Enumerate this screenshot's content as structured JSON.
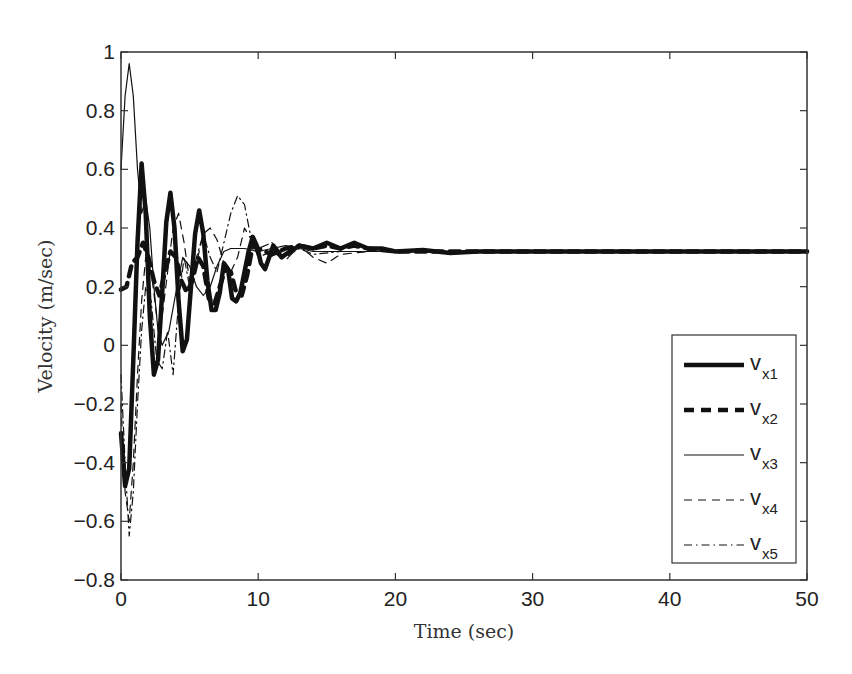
{
  "chart_data": {
    "type": "line",
    "title": "",
    "xlabel": "Time (sec)",
    "ylabel": "Velocity (m/sec)",
    "xlim": [
      0,
      50
    ],
    "ylim": [
      -0.8,
      1
    ],
    "xticks": [
      0,
      10,
      20,
      30,
      40,
      50
    ],
    "yticks": [
      -0.8,
      -0.6,
      -0.4,
      -0.2,
      0,
      0.2,
      0.4,
      0.6,
      0.8,
      1
    ],
    "grid": false,
    "legend_position": "lower right",
    "steady_state_value": 0.32,
    "series": [
      {
        "name": "v_x1",
        "label_main": "v",
        "label_sub": "x1",
        "style": "solid-thick",
        "x": [
          0,
          0.3,
          0.6,
          0.9,
          1.2,
          1.5,
          1.8,
          2.1,
          2.4,
          2.7,
          3.0,
          3.3,
          3.6,
          3.9,
          4.2,
          4.5,
          4.8,
          5.1,
          5.4,
          5.7,
          6.0,
          6.3,
          6.6,
          6.9,
          7.2,
          7.5,
          7.8,
          8.1,
          8.4,
          8.7,
          9.0,
          9.3,
          9.6,
          9.9,
          10.2,
          10.5,
          10.8,
          11.1,
          11.4,
          11.7,
          12,
          13,
          14,
          15,
          16,
          17,
          18,
          19,
          20,
          22,
          24,
          26,
          28,
          30,
          35,
          40,
          45,
          50
        ],
        "y": [
          -0.3,
          -0.48,
          -0.42,
          -0.05,
          0.35,
          0.62,
          0.45,
          0.1,
          -0.1,
          -0.05,
          0.18,
          0.42,
          0.52,
          0.4,
          0.15,
          -0.02,
          0.02,
          0.2,
          0.38,
          0.46,
          0.38,
          0.22,
          0.12,
          0.12,
          0.18,
          0.28,
          0.26,
          0.16,
          0.15,
          0.18,
          0.25,
          0.32,
          0.37,
          0.34,
          0.28,
          0.26,
          0.3,
          0.34,
          0.32,
          0.3,
          0.31,
          0.34,
          0.33,
          0.35,
          0.33,
          0.35,
          0.33,
          0.33,
          0.32,
          0.325,
          0.315,
          0.32,
          0.32,
          0.32,
          0.32,
          0.32,
          0.32,
          0.32
        ]
      },
      {
        "name": "v_x2",
        "label_main": "v",
        "label_sub": "x2",
        "style": "dashed-thick",
        "x": [
          0,
          0.4,
          0.8,
          1.2,
          1.6,
          2.0,
          2.4,
          2.8,
          3.2,
          3.6,
          4.0,
          4.4,
          4.8,
          5.2,
          5.6,
          6.0,
          6.4,
          6.8,
          7.2,
          7.6,
          8.0,
          8.4,
          8.8,
          9.2,
          9.6,
          10,
          11,
          12,
          13,
          14,
          15,
          16,
          17,
          18,
          20,
          25,
          30,
          40,
          50
        ],
        "y": [
          0.19,
          0.2,
          0.28,
          0.3,
          0.35,
          0.3,
          0.22,
          0.17,
          0.25,
          0.32,
          0.3,
          0.22,
          0.18,
          0.22,
          0.3,
          0.27,
          0.16,
          0.14,
          0.2,
          0.26,
          0.25,
          0.18,
          0.17,
          0.24,
          0.34,
          0.33,
          0.31,
          0.33,
          0.34,
          0.33,
          0.34,
          0.33,
          0.34,
          0.33,
          0.32,
          0.32,
          0.32,
          0.32,
          0.32
        ]
      },
      {
        "name": "v_x3",
        "label_main": "v",
        "label_sub": "x3",
        "style": "solid-thin",
        "x": [
          0,
          0.3,
          0.6,
          0.9,
          1.2,
          1.5,
          1.8,
          2.1,
          2.4,
          2.7,
          3.0,
          3.5,
          4.0,
          4.5,
          5.0,
          5.5,
          6.0,
          6.5,
          7.0,
          7.5,
          8.0,
          9.0,
          10,
          11,
          12,
          13,
          14,
          16,
          18,
          20,
          30,
          40,
          50
        ],
        "y": [
          0.6,
          0.85,
          0.96,
          0.85,
          0.6,
          0.45,
          0.5,
          0.4,
          0.2,
          0.05,
          0.0,
          0.05,
          0.18,
          0.3,
          0.27,
          0.2,
          0.17,
          0.2,
          0.27,
          0.32,
          0.33,
          0.33,
          0.32,
          0.33,
          0.34,
          0.33,
          0.32,
          0.32,
          0.32,
          0.32,
          0.32,
          0.32,
          0.32
        ]
      },
      {
        "name": "v_x4",
        "label_main": "v",
        "label_sub": "x4",
        "style": "dashed-thin",
        "x": [
          0,
          0.3,
          0.6,
          0.9,
          1.2,
          1.5,
          1.8,
          2.2,
          2.6,
          3.0,
          3.4,
          3.8,
          4.2,
          4.6,
          5.0,
          5.5,
          6.0,
          6.5,
          7.0,
          7.5,
          8.0,
          8.5,
          9.0,
          9.5,
          10,
          11,
          12,
          13,
          14,
          15,
          16,
          18,
          20,
          30,
          40,
          50
        ],
        "y": [
          -0.2,
          -0.5,
          -0.6,
          -0.4,
          -0.1,
          0.15,
          0.3,
          0.25,
          0.1,
          0.1,
          0.25,
          0.4,
          0.45,
          0.35,
          0.22,
          0.28,
          0.38,
          0.4,
          0.36,
          0.28,
          0.25,
          0.3,
          0.4,
          0.36,
          0.3,
          0.32,
          0.29,
          0.34,
          0.3,
          0.28,
          0.31,
          0.32,
          0.32,
          0.32,
          0.32,
          0.32
        ]
      },
      {
        "name": "v_x5",
        "label_main": "v",
        "label_sub": "x5",
        "style": "dashdot-thin",
        "x": [
          0,
          0.3,
          0.6,
          0.9,
          1.2,
          1.5,
          1.8,
          2.2,
          2.6,
          3.0,
          3.4,
          3.8,
          4.2,
          4.6,
          5.0,
          5.5,
          6.0,
          6.5,
          7.0,
          7.5,
          8.0,
          8.5,
          9.0,
          9.5,
          10,
          11,
          12,
          13,
          14,
          16,
          18,
          20,
          30,
          40,
          50
        ],
        "y": [
          -0.1,
          -0.4,
          -0.65,
          -0.5,
          -0.2,
          0.05,
          0.2,
          0.15,
          -0.05,
          -0.08,
          0.05,
          -0.1,
          0.15,
          0.3,
          0.2,
          0.3,
          0.38,
          0.3,
          0.25,
          0.35,
          0.45,
          0.51,
          0.48,
          0.36,
          0.33,
          0.35,
          0.3,
          0.33,
          0.31,
          0.32,
          0.32,
          0.32,
          0.32,
          0.32,
          0.32
        ]
      }
    ]
  },
  "axes": {
    "xlabel": "Time (sec)",
    "ylabel": "Velocity (m/sec)"
  }
}
